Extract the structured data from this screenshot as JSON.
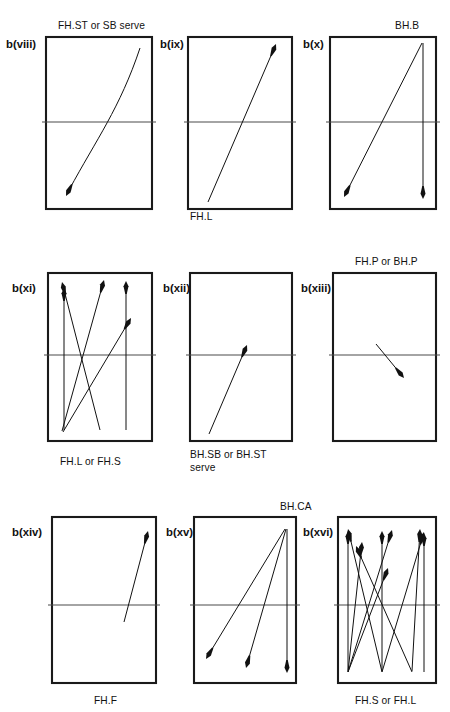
{
  "figure": {
    "type": "technical-diagram",
    "width": 450,
    "height": 712,
    "background_color": "#ffffff",
    "line_color": "#111111",
    "net_color": "#4a4a4a"
  },
  "panels": [
    {
      "id": "b(viii)",
      "id_pos": {
        "x": 6,
        "y": 39
      },
      "label": "FH.ST or SB serve",
      "label_pos": {
        "x": 58,
        "y": 21
      },
      "label_align": "above",
      "court": {
        "x": 46,
        "y": 37,
        "w": 106,
        "h": 172
      },
      "net_y": 122,
      "net_x1": 46,
      "net_x2": 152,
      "shots": [
        {
          "kind": "curve",
          "from": {
            "x": 140,
            "y": 48
          },
          "to": {
            "x": 66,
            "y": 196
          },
          "control1": {
            "x": 120,
            "y": 108
          },
          "control2": {
            "x": 96,
            "y": 140
          },
          "head_angle_deg": 117
        }
      ]
    },
    {
      "id": "b(ix)",
      "id_pos": {
        "x": 160,
        "y": 39
      },
      "label": "FH.L",
      "label_pos": {
        "x": 190,
        "y": 212
      },
      "label_align": "below",
      "court": {
        "x": 188,
        "y": 37,
        "w": 104,
        "h": 172
      },
      "net_y": 122,
      "net_x1": 188,
      "net_x2": 292,
      "shots": [
        {
          "kind": "line",
          "from": {
            "x": 208,
            "y": 202
          },
          "to": {
            "x": 276,
            "y": 44
          },
          "head_angle_deg": -66.7
        }
      ]
    },
    {
      "id": "b(x)",
      "id_pos": {
        "x": 303,
        "y": 39
      },
      "label": "BH.B",
      "label_pos": {
        "x": 395,
        "y": 21
      },
      "label_align": "above",
      "court": {
        "x": 330,
        "y": 37,
        "w": 106,
        "h": 172
      },
      "net_y": 122,
      "net_x1": 330,
      "net_x2": 436,
      "shots": [
        {
          "kind": "line",
          "from": {
            "x": 422,
            "y": 43
          },
          "to": {
            "x": 344,
            "y": 197
          },
          "head_angle_deg": 116.9
        },
        {
          "kind": "line",
          "from": {
            "x": 423,
            "y": 43
          },
          "to": {
            "x": 423,
            "y": 199
          },
          "head_angle_deg": 90
        }
      ]
    },
    {
      "id": "b(xi)",
      "id_pos": {
        "x": 12,
        "y": 283
      },
      "label": "FH.L or FH.S",
      "label_pos": {
        "x": 60,
        "y": 457
      },
      "label_align": "below",
      "court": {
        "x": 48,
        "y": 273,
        "w": 104,
        "h": 168
      },
      "net_y": 355,
      "net_x1": 48,
      "net_x2": 152,
      "shots": [
        {
          "kind": "line",
          "from": {
            "x": 64,
            "y": 430
          },
          "to": {
            "x": 64,
            "y": 288
          },
          "head_angle_deg": -90
        },
        {
          "kind": "line",
          "from": {
            "x": 100,
            "y": 430
          },
          "to": {
            "x": 62,
            "y": 282
          },
          "head_angle_deg": -104.4
        },
        {
          "kind": "line",
          "from": {
            "x": 62,
            "y": 431
          },
          "to": {
            "x": 104,
            "y": 280
          },
          "head_angle_deg": -74.5
        },
        {
          "kind": "line",
          "from": {
            "x": 126,
            "y": 430
          },
          "to": {
            "x": 126,
            "y": 281
          },
          "head_angle_deg": -90
        },
        {
          "kind": "line",
          "from": {
            "x": 63,
            "y": 432
          },
          "to": {
            "x": 131,
            "y": 318
          },
          "head_angle_deg": -59.2
        }
      ]
    },
    {
      "id": "b(xii)",
      "id_pos": {
        "x": 163,
        "y": 283
      },
      "label": "BH.SB or BH.ST\nserve",
      "label_pos": {
        "x": 190,
        "y": 449
      },
      "label_align": "below",
      "court": {
        "x": 190,
        "y": 273,
        "w": 102,
        "h": 168
      },
      "net_y": 355,
      "net_x1": 190,
      "net_x2": 292,
      "shots": [
        {
          "kind": "line",
          "from": {
            "x": 209,
            "y": 434
          },
          "to": {
            "x": 247,
            "y": 345
          },
          "head_angle_deg": -66.9
        }
      ]
    },
    {
      "id": "b(xiii)",
      "id_pos": {
        "x": 301,
        "y": 283
      },
      "label": "FH.P or BH.P",
      "label_pos": {
        "x": 355,
        "y": 257
      },
      "label_align": "above",
      "court": {
        "x": 333,
        "y": 273,
        "w": 103,
        "h": 168
      },
      "net_y": 355,
      "net_x1": 333,
      "net_x2": 436,
      "shots": [
        {
          "kind": "line",
          "from": {
            "x": 376,
            "y": 344
          },
          "to": {
            "x": 404,
            "y": 378
          },
          "head_angle_deg": 50.5
        }
      ]
    },
    {
      "id": "b(xiv)",
      "id_pos": {
        "x": 12,
        "y": 527
      },
      "label": "FH.F",
      "label_pos": {
        "x": 94,
        "y": 696
      },
      "label_align": "below",
      "court": {
        "x": 52,
        "y": 517,
        "w": 104,
        "h": 166
      },
      "net_y": 605,
      "net_x1": 52,
      "net_x2": 156,
      "shots": [
        {
          "kind": "line",
          "from": {
            "x": 124,
            "y": 622
          },
          "to": {
            "x": 148,
            "y": 531
          },
          "head_angle_deg": -75.2
        }
      ]
    },
    {
      "id": "b(xv)",
      "id_pos": {
        "x": 166,
        "y": 527
      },
      "label": "BH.CA",
      "label_pos": {
        "x": 280,
        "y": 502
      },
      "label_align": "above",
      "court": {
        "x": 194,
        "y": 517,
        "w": 102,
        "h": 166
      },
      "net_y": 605,
      "net_x1": 194,
      "net_x2": 296,
      "shots": [
        {
          "kind": "line",
          "from": {
            "x": 285,
            "y": 529
          },
          "to": {
            "x": 206,
            "y": 659
          },
          "head_angle_deg": 121.3
        },
        {
          "kind": "line",
          "from": {
            "x": 286,
            "y": 529
          },
          "to": {
            "x": 246,
            "y": 668
          },
          "head_angle_deg": 106
        },
        {
          "kind": "line",
          "from": {
            "x": 287,
            "y": 529
          },
          "to": {
            "x": 287,
            "y": 673
          },
          "head_angle_deg": 90
        }
      ]
    },
    {
      "id": "b(xvi)",
      "id_pos": {
        "x": 303,
        "y": 527
      },
      "label": "FH.S or FH.L",
      "label_pos": {
        "x": 355,
        "y": 696
      },
      "label_align": "below",
      "court": {
        "x": 338,
        "y": 517,
        "w": 98,
        "h": 166
      },
      "net_y": 605,
      "net_x1": 338,
      "net_x2": 436,
      "shots": [
        {
          "kind": "line",
          "from": {
            "x": 382,
            "y": 672
          },
          "to": {
            "x": 348,
            "y": 529
          },
          "head_angle_deg": -103.4
        },
        {
          "kind": "line",
          "from": {
            "x": 412,
            "y": 672
          },
          "to": {
            "x": 356,
            "y": 546
          },
          "head_angle_deg": -114
        },
        {
          "kind": "line",
          "from": {
            "x": 348,
            "y": 671
          },
          "to": {
            "x": 348,
            "y": 531
          },
          "head_angle_deg": -90
        },
        {
          "kind": "line",
          "from": {
            "x": 348,
            "y": 672
          },
          "to": {
            "x": 362,
            "y": 542
          },
          "head_angle_deg": -83.9
        },
        {
          "kind": "line",
          "from": {
            "x": 348,
            "y": 672
          },
          "to": {
            "x": 388,
            "y": 568
          },
          "head_angle_deg": -69
        },
        {
          "kind": "line",
          "from": {
            "x": 382,
            "y": 671
          },
          "to": {
            "x": 382,
            "y": 531
          },
          "head_angle_deg": -90
        },
        {
          "kind": "line",
          "from": {
            "x": 348,
            "y": 672
          },
          "to": {
            "x": 392,
            "y": 530
          },
          "head_angle_deg": -72.8
        },
        {
          "kind": "line",
          "from": {
            "x": 382,
            "y": 672
          },
          "to": {
            "x": 424,
            "y": 532
          },
          "head_angle_deg": -73.3
        },
        {
          "kind": "line",
          "from": {
            "x": 412,
            "y": 671
          },
          "to": {
            "x": 420,
            "y": 529
          },
          "head_angle_deg": -86.8
        },
        {
          "kind": "line",
          "from": {
            "x": 424,
            "y": 672
          },
          "to": {
            "x": 424,
            "y": 533
          },
          "head_angle_deg": -90
        }
      ]
    }
  ]
}
